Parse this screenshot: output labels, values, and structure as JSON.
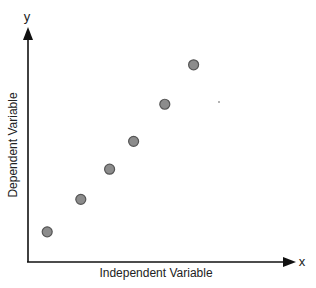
{
  "chart_data": {
    "type": "scatter",
    "title": "",
    "xlabel": "Independent Variable",
    "ylabel": "Dependent Variable",
    "x_axis_symbol": "x",
    "y_axis_symbol": "y",
    "grid": false,
    "legend": null,
    "ticks": false,
    "xlim": [
      0,
      10
    ],
    "ylim": [
      0,
      10
    ],
    "points": [
      {
        "x": 0.8,
        "y": 1.3
      },
      {
        "x": 2.2,
        "y": 2.7
      },
      {
        "x": 3.4,
        "y": 4.0
      },
      {
        "x": 4.4,
        "y": 5.2
      },
      {
        "x": 5.7,
        "y": 6.8
      },
      {
        "x": 6.9,
        "y": 8.5
      }
    ],
    "marker_color": "#8c8c8c",
    "marker_edge": "#555555"
  }
}
